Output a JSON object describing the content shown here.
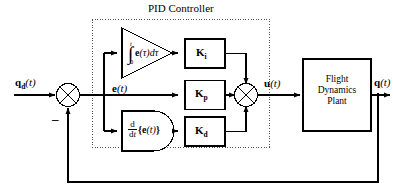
{
  "diagram": {
    "title": "PID Controller",
    "controller_group_label": "PID Controller",
    "signals": {
      "reference_label_main": "q",
      "reference_label_sub": "d",
      "reference_label_arg": "(t)",
      "error_label_main": "e",
      "error_label_arg": "(t)",
      "control_label_main": "u",
      "control_label_arg": "(t)",
      "output_label_main": "q",
      "output_label_arg": "(t)",
      "feedback_sign": "–"
    },
    "integral_block": {
      "name": "integral-block",
      "shape": "triangle",
      "upper_limit": "t",
      "lower_limit": "0",
      "integral_sign": "∫",
      "integrand_main": "e",
      "integrand_var": "(τ)",
      "differential": "dτ"
    },
    "derivative_block": {
      "name": "derivative-block",
      "shape": "d-shape",
      "numerator": "d",
      "denominator_d": "d",
      "denominator_t": "t",
      "argument_open": "{",
      "argument_main": "e",
      "argument_arg": "(t)",
      "argument_close": "}"
    },
    "gain_blocks": [
      {
        "id": "ki",
        "label_main": "K",
        "label_sub": "i"
      },
      {
        "id": "kp",
        "label_main": "K",
        "label_sub": "p"
      },
      {
        "id": "kd",
        "label_main": "K",
        "label_sub": "d"
      }
    ],
    "plant_block": {
      "line1": "Flight",
      "line2": "Dynamics",
      "line3": "Plant"
    },
    "summing_junctions": [
      {
        "id": "error-sum",
        "symbol": "circle-cross"
      },
      {
        "id": "control-sum",
        "symbol": "circle-cross"
      }
    ],
    "colors": {
      "line": "#000000",
      "background": "#ffffff",
      "group_border": "#555555"
    }
  }
}
